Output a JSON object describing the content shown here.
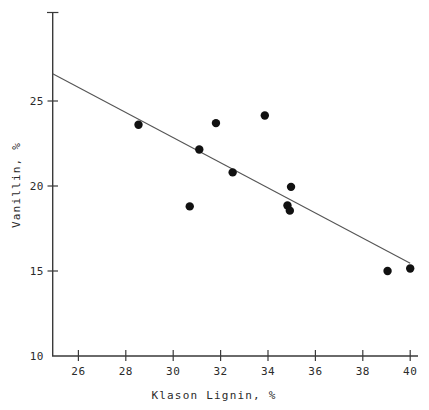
{
  "chart_data": {
    "type": "scatter",
    "title": "",
    "xlabel": "Klason Lignin, %",
    "ylabel": "Vanillin, %",
    "xlim": [
      25,
      40
    ],
    "ylim": [
      10,
      27.5
    ],
    "xticks": [
      26,
      28,
      30,
      32,
      34,
      36,
      38,
      40
    ],
    "xtick_labels": [
      "26",
      "28",
      "30",
      "32",
      "34",
      "36",
      "38",
      "40"
    ],
    "yticks": [
      15,
      20,
      25
    ],
    "ytick_labels": [
      "15",
      "20",
      "25"
    ],
    "y_axis_origin_label": "10",
    "grid": false,
    "legend": false,
    "marker": "filled-circle",
    "marker_color": "#111111",
    "line_color": "#555555",
    "axis_color": "#3a3a3a",
    "points": [
      {
        "x": 28.6,
        "y": 23.6
      },
      {
        "x": 30.75,
        "y": 18.8
      },
      {
        "x": 31.15,
        "y": 22.15
      },
      {
        "x": 31.85,
        "y": 23.7
      },
      {
        "x": 32.55,
        "y": 20.8
      },
      {
        "x": 33.9,
        "y": 24.15
      },
      {
        "x": 34.85,
        "y": 18.85
      },
      {
        "x": 34.95,
        "y": 18.55
      },
      {
        "x": 35.0,
        "y": 19.95
      },
      {
        "x": 39.05,
        "y": 15.0
      },
      {
        "x": 40.0,
        "y": 15.15
      }
    ],
    "fit_line": {
      "x_start": 25.0,
      "y_start": 26.6,
      "x_end": 40.0,
      "y_end": 15.45,
      "slope": -0.743,
      "intercept": 45.18
    }
  },
  "labels": {
    "xaxis_title": "Klason Lignin, %",
    "yaxis_title": "Vanillin, %",
    "x_26": "26",
    "x_28": "28",
    "x_30": "30",
    "x_32": "32",
    "x_34": "34",
    "x_36": "36",
    "x_38": "38",
    "x_40": "40",
    "y_10": "10",
    "y_15": "15",
    "y_20": "20",
    "y_25": "25"
  }
}
